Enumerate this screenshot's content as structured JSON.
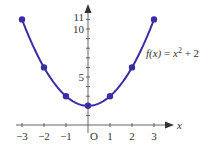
{
  "chart_data": {
    "type": "line",
    "title": "",
    "function_label": "f(x) = x² + 2",
    "function_label_parts": {
      "lhs": "f(x)",
      "eq": " = ",
      "var": "x",
      "exp": "2",
      "rest": " + 2"
    },
    "xlabel": "x",
    "ylabel": "",
    "origin_label": "O",
    "x": [
      -3,
      -2,
      -1,
      0,
      1,
      2,
      3
    ],
    "y": [
      11,
      6,
      3,
      2,
      3,
      6,
      11
    ],
    "series": [
      {
        "name": "f(x) = x^2 + 2",
        "x": [
          -3,
          -2,
          -1,
          0,
          1,
          2,
          3
        ],
        "values": [
          11,
          6,
          3,
          2,
          3,
          6,
          11
        ],
        "markers": true,
        "smooth_curve": true
      }
    ],
    "xlim": [
      -3,
      3
    ],
    "ylim": [
      0,
      11
    ],
    "x_tick_labels": [
      "−3",
      "−2",
      "−1",
      "1",
      "2",
      "3"
    ],
    "y_tick_labels": [
      "5",
      "10",
      "11"
    ],
    "grid": false,
    "legend": null,
    "colors": {
      "curve": "#3a2fa0",
      "axis": "#555555"
    }
  }
}
